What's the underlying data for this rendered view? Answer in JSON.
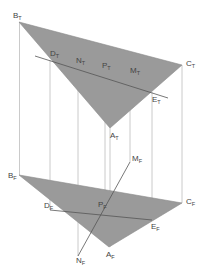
{
  "diagram": {
    "type": "descriptive-geometry-projection",
    "colors": {
      "plane_fill": "#9a9a9a",
      "plane_edge": "#8a8a8a",
      "projector": "#bdbdbd",
      "line": "#555555",
      "label": "#444444",
      "background": "#ffffff"
    },
    "top_view": {
      "plane_label": "ABC (top view)",
      "points": {
        "B": {
          "name": "B",
          "sub": "T"
        },
        "C": {
          "name": "C",
          "sub": "T"
        },
        "A": {
          "name": "A",
          "sub": "T"
        },
        "D": {
          "name": "D",
          "sub": "T"
        },
        "N": {
          "name": "N",
          "sub": "T"
        },
        "P": {
          "name": "P",
          "sub": "T"
        },
        "M": {
          "name": "M",
          "sub": "T"
        },
        "E": {
          "name": "E",
          "sub": "T"
        }
      }
    },
    "front_view": {
      "plane_label": "ABC (front view)",
      "points": {
        "B": {
          "name": "B",
          "sub": "F"
        },
        "C": {
          "name": "C",
          "sub": "F"
        },
        "A": {
          "name": "A",
          "sub": "F"
        },
        "D": {
          "name": "D",
          "sub": "F"
        },
        "E": {
          "name": "E",
          "sub": "F"
        },
        "P": {
          "name": "P",
          "sub": "F"
        },
        "M": {
          "name": "M",
          "sub": "F"
        },
        "N": {
          "name": "N",
          "sub": "F"
        }
      }
    }
  }
}
